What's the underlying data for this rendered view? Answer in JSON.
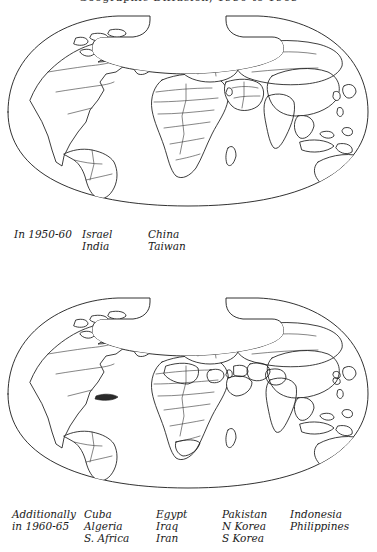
{
  "figure": {
    "title": "Geographic Diffusion, 1950 to 1965",
    "title_cropped": true
  },
  "panels": [
    {
      "id": "panel-top",
      "period_label": "In 1950-60",
      "projection": "interrupted oval world map",
      "shaded_countries": [
        "Israel",
        "India",
        "China",
        "Taiwan"
      ],
      "caption_columns": [
        {
          "name": "period",
          "lines": [
            "In 1950-60"
          ]
        },
        {
          "name": "group-1",
          "lines": [
            "Israel",
            "India"
          ]
        },
        {
          "name": "group-2",
          "lines": [
            "China",
            "Taiwan"
          ]
        }
      ]
    },
    {
      "id": "panel-bottom",
      "period_label": "Additionally in 1960-65",
      "projection": "interrupted oval world map",
      "shaded_countries": [
        "Cuba",
        "Algeria",
        "S. Africa",
        "Egypt",
        "Iraq",
        "Iran",
        "Pakistan",
        "N Korea",
        "S Korea",
        "Indonesia",
        "Philippines",
        "Israel",
        "India",
        "China",
        "Taiwan"
      ],
      "caption_columns": [
        {
          "name": "period",
          "lines": [
            "Additionally",
            "in 1960-65"
          ]
        },
        {
          "name": "group-1",
          "lines": [
            "Cuba",
            "Algeria",
            "S. Africa"
          ]
        },
        {
          "name": "group-2",
          "lines": [
            "Egypt",
            "Iraq",
            "Iran"
          ]
        },
        {
          "name": "group-3",
          "lines": [
            "Pakistan",
            "N Korea",
            "S Korea"
          ]
        },
        {
          "name": "group-4",
          "lines": [
            "Indonesia",
            "Philippines"
          ]
        }
      ]
    }
  ],
  "style": {
    "ink_color": "#1b1b1b",
    "border_color": "#3a3a3a",
    "background": "#ffffff",
    "shaded_fill": "stipple",
    "solid_fill": "#2a2a2a"
  }
}
